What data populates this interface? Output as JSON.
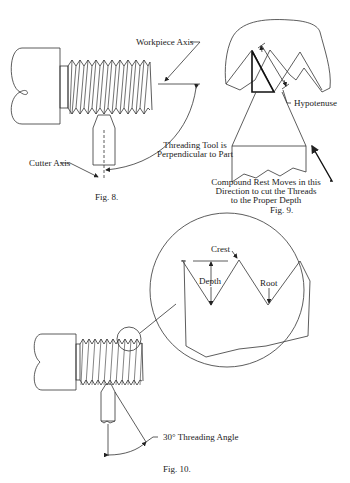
{
  "figures": {
    "fig8": {
      "caption": "Fig. 8.",
      "labels": {
        "workpiece_axis": "Workpiece Axis",
        "tool_line1": "Threading Tool is",
        "tool_line2": "Perpendicular to Part",
        "cutter_axis": "Cutter Axis"
      }
    },
    "fig9": {
      "caption": "Fig. 9.",
      "labels": {
        "hypotenuse": "Hypotenuse",
        "compound_line1": "Compound Rest Moves in this",
        "compound_line2": "Direction to cut the Threads",
        "compound_line3": "to the Proper Depth"
      }
    },
    "fig10": {
      "caption": "Fig. 10.",
      "labels": {
        "crest": "Crest",
        "depth": "Depth",
        "root": "Root",
        "angle": "30° Threading Angle"
      }
    }
  },
  "colors": {
    "line": "#333333",
    "background": "#ffffff"
  }
}
